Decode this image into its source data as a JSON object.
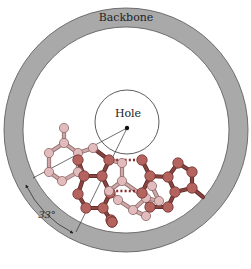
{
  "figure": {
    "labels": {
      "backbone": "Backbone",
      "hole": "Hole",
      "angle": "33°"
    },
    "colors": {
      "backbone_fill": "#a9a9a9",
      "backbone_stroke": "#555555",
      "background": "#ffffff",
      "dark_atom": "#b5635f",
      "dark_atom_stroke": "#6e3330",
      "light_atom": "#e2bcbc",
      "light_atom_stroke": "#8c6666",
      "dark_bond": "#8a4440",
      "light_bond": "#cfa8a8",
      "hbond": "#8a2b2b"
    },
    "backbone": {
      "cx": 126,
      "cy": 130,
      "r_outer": 122,
      "r_inner": 103
    },
    "hole": {
      "cx": 127,
      "cy": 122,
      "r": 32,
      "center_dot": [
        127,
        128
      ]
    },
    "angle_lines": [
      {
        "from": [
          127,
          128
        ],
        "to": [
          33,
          178
        ]
      },
      {
        "from": [
          127,
          128
        ],
        "to": [
          76,
          232
        ]
      }
    ],
    "angle_arc": {
      "from": [
        26,
        185
      ],
      "to": [
        73,
        233
      ],
      "label_pos": [
        43,
        216
      ]
    },
    "atoms": [
      {
        "id": "L1",
        "x": 64,
        "y": 128,
        "t": "light"
      },
      {
        "id": "L2",
        "x": 64,
        "y": 143,
        "t": "light"
      },
      {
        "id": "L3",
        "x": 49,
        "y": 153,
        "t": "light"
      },
      {
        "id": "L4",
        "x": 49,
        "y": 172,
        "t": "light"
      },
      {
        "id": "L5",
        "x": 62,
        "y": 181,
        "t": "light"
      },
      {
        "id": "L6",
        "x": 78,
        "y": 172,
        "t": "light"
      },
      {
        "id": "L7",
        "x": 78,
        "y": 153,
        "t": "light"
      },
      {
        "id": "L8",
        "x": 93,
        "y": 148,
        "t": "light"
      },
      {
        "id": "D1",
        "x": 78,
        "y": 160,
        "t": "dark"
      },
      {
        "id": "D2",
        "x": 84,
        "y": 176,
        "t": "dark"
      },
      {
        "id": "D3",
        "x": 78,
        "y": 194,
        "t": "dark"
      },
      {
        "id": "D4",
        "x": 86,
        "y": 208,
        "t": "dark"
      },
      {
        "id": "D5",
        "x": 103,
        "y": 208,
        "t": "dark"
      },
      {
        "id": "D6",
        "x": 110,
        "y": 193,
        "t": "dark"
      },
      {
        "id": "D7",
        "x": 102,
        "y": 176,
        "t": "dark"
      },
      {
        "id": "D8",
        "x": 109,
        "y": 160,
        "t": "dark"
      },
      {
        "id": "D9",
        "x": 111,
        "y": 220,
        "t": "dark"
      },
      {
        "id": "D10",
        "x": 112,
        "y": 222,
        "t": "dark"
      },
      {
        "id": "P1",
        "x": 122,
        "y": 163,
        "t": "light"
      },
      {
        "id": "P2",
        "x": 122,
        "y": 181,
        "t": "light"
      },
      {
        "id": "P3",
        "x": 109,
        "y": 191,
        "t": "light"
      },
      {
        "id": "P4",
        "x": 118,
        "y": 200,
        "t": "light"
      },
      {
        "id": "P5",
        "x": 133,
        "y": 210,
        "t": "light"
      },
      {
        "id": "P6",
        "x": 146,
        "y": 198,
        "t": "light"
      },
      {
        "id": "P7",
        "x": 152,
        "y": 186,
        "t": "light"
      },
      {
        "id": "P8",
        "x": 159,
        "y": 201,
        "t": "light"
      },
      {
        "id": "P9",
        "x": 146,
        "y": 216,
        "t": "light"
      },
      {
        "id": "E1",
        "x": 142,
        "y": 160,
        "t": "dark"
      },
      {
        "id": "E2",
        "x": 150,
        "y": 176,
        "t": "dark"
      },
      {
        "id": "E3",
        "x": 142,
        "y": 193,
        "t": "dark"
      },
      {
        "id": "E4",
        "x": 150,
        "y": 207,
        "t": "dark"
      },
      {
        "id": "E5",
        "x": 168,
        "y": 207,
        "t": "dark"
      },
      {
        "id": "E6",
        "x": 175,
        "y": 192,
        "t": "dark"
      },
      {
        "id": "E7",
        "x": 168,
        "y": 177,
        "t": "dark"
      },
      {
        "id": "F1",
        "x": 178,
        "y": 163,
        "t": "dark"
      },
      {
        "id": "F2",
        "x": 192,
        "y": 172,
        "t": "dark"
      },
      {
        "id": "F3",
        "x": 192,
        "y": 188,
        "t": "dark"
      },
      {
        "id": "D11",
        "x": 112,
        "y": 222,
        "t": "dark"
      }
    ],
    "bonds": [
      [
        "L1",
        "L2",
        "light"
      ],
      [
        "L2",
        "L3",
        "light"
      ],
      [
        "L3",
        "L4",
        "light"
      ],
      [
        "L4",
        "L5",
        "light"
      ],
      [
        "L5",
        "L6",
        "light"
      ],
      [
        "L6",
        "L7",
        "light"
      ],
      [
        "L7",
        "L2",
        "light"
      ],
      [
        "L7",
        "L8",
        "light"
      ],
      [
        "L8",
        "D8",
        "dark"
      ],
      [
        "D1",
        "D2",
        "dark"
      ],
      [
        "D2",
        "D3",
        "dark"
      ],
      [
        "D3",
        "D4",
        "dark"
      ],
      [
        "D4",
        "D5",
        "dark"
      ],
      [
        "D5",
        "D6",
        "dark"
      ],
      [
        "D6",
        "D7",
        "dark"
      ],
      [
        "D7",
        "D2",
        "dark"
      ],
      [
        "D7",
        "D8",
        "dark"
      ],
      [
        "D1",
        "L7",
        "dark"
      ],
      [
        "D5",
        "D11",
        "dark"
      ],
      [
        "D8",
        "P1",
        "light"
      ],
      [
        "P1",
        "P2",
        "light"
      ],
      [
        "P2",
        "P3",
        "light"
      ],
      [
        "P3",
        "P4",
        "light"
      ],
      [
        "P4",
        "P5",
        "light"
      ],
      [
        "P5",
        "P6",
        "light"
      ],
      [
        "P6",
        "P2",
        "light"
      ],
      [
        "P5",
        "P9",
        "light"
      ],
      [
        "P7",
        "P8",
        "light"
      ],
      [
        "P8",
        "P6",
        "light"
      ],
      [
        "E1",
        "E2",
        "dark"
      ],
      [
        "E2",
        "E3",
        "dark"
      ],
      [
        "E3",
        "E4",
        "dark"
      ],
      [
        "E4",
        "E5",
        "dark"
      ],
      [
        "E5",
        "E6",
        "dark"
      ],
      [
        "E6",
        "E7",
        "dark"
      ],
      [
        "E7",
        "E2",
        "dark"
      ],
      [
        "E7",
        "F1",
        "dark"
      ],
      [
        "F1",
        "F2",
        "dark"
      ],
      [
        "F2",
        "F3",
        "dark"
      ],
      [
        "F3",
        "E6",
        "dark"
      ],
      [
        "F3",
        "F4",
        "dark"
      ]
    ],
    "hbonds": [
      {
        "from": [
          112,
          160
        ],
        "to": [
          140,
          160
        ]
      },
      {
        "from": [
          112,
          191
        ],
        "to": [
          140,
          191
        ]
      }
    ],
    "tail_bond": {
      "from": [
        192,
        188
      ],
      "to": [
        203,
        197
      ]
    }
  }
}
